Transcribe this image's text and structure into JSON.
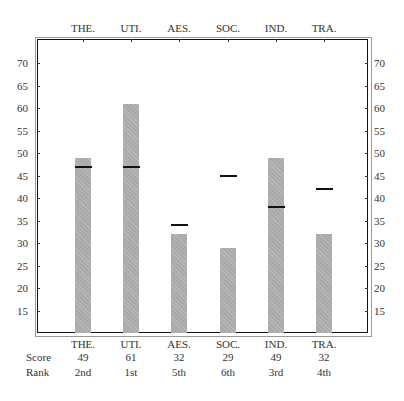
{
  "chart_data": {
    "type": "bar",
    "title": "",
    "xlabel": "",
    "ylabel": "",
    "categories": [
      "THE.",
      "UTI.",
      "AES.",
      "SOC.",
      "IND.",
      "TRA."
    ],
    "series": [
      {
        "name": "Score",
        "values": [
          49,
          61,
          32,
          29,
          49,
          32
        ]
      },
      {
        "name": "Norm marker",
        "values": [
          47,
          47,
          34,
          45,
          38,
          42
        ]
      }
    ],
    "ranks": [
      "2nd",
      "1st",
      "5th",
      "6th",
      "3rd",
      "4th"
    ],
    "ylim": [
      10,
      75
    ],
    "yticks": [
      15,
      20,
      25,
      30,
      35,
      40,
      45,
      50,
      55,
      60,
      65,
      70
    ],
    "grid": false,
    "legend": "none"
  },
  "table": {
    "score_label": "Score",
    "rank_label": "Rank"
  }
}
